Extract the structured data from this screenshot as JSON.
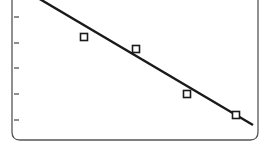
{
  "chart_data": {
    "type": "scatter",
    "title": "",
    "xlabel": "",
    "ylabel": "",
    "y_ticks": 5,
    "grid": false,
    "legend": null,
    "series": [
      {
        "name": "observations",
        "marker": "open-square",
        "points": [
          {
            "x": 84,
            "y": 37
          },
          {
            "x": 136,
            "y": 49
          },
          {
            "x": 187,
            "y": 94
          },
          {
            "x": 236,
            "y": 115
          }
        ]
      },
      {
        "name": "fit-line",
        "style": "solid",
        "points": [
          {
            "x": 38,
            "y": -2
          },
          {
            "x": 253,
            "y": 125
          }
        ]
      }
    ],
    "colors": {
      "ink": "#1a1a1a",
      "background": "#ffffff",
      "frame": "#555555"
    }
  }
}
